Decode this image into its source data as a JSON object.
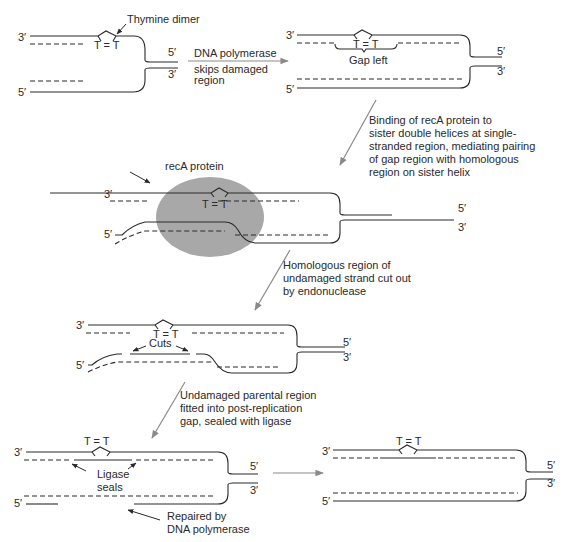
{
  "diagram": {
    "type": "post-replication recombination repair of thymine dimer",
    "colors": {
      "strand": "#2a2a2a",
      "step_arrow": "#8a8a8a",
      "recA_protein": "#a8a8a8",
      "background": "#ffffff"
    }
  },
  "ends": {
    "three_prime": "3′",
    "five_prime": "5′"
  },
  "lesion": {
    "label": "T = T"
  },
  "panel1": {
    "callout": "Thymine dimer"
  },
  "step1": {
    "line1": "DNA polymerase",
    "line2": "skips damaged",
    "line3": "region"
  },
  "panel2": {
    "callout": "Gap left"
  },
  "step2": {
    "line1": "Binding of recA protein to",
    "line2": "sister double helices at single-",
    "line3": "stranded region, mediating pairing",
    "line4": "of gap region with homologous",
    "line5": "region on sister helix"
  },
  "panel3": {
    "callout": "recA  protein"
  },
  "step3": {
    "line1": "Homologous region of",
    "line2": "undamaged strand cut out",
    "line3": "by endonuclease"
  },
  "panel4": {
    "callout": "Cuts"
  },
  "step4": {
    "line1": "Undamaged parental region",
    "line2": "fitted into post-replication",
    "line3": "gap, sealed with ligase"
  },
  "panel5": {
    "callout_ligase_1": "Ligase",
    "callout_ligase_2": "seals",
    "callout_repair_1": "Repaired by",
    "callout_repair_2": "DNA polymerase"
  },
  "panel6": {}
}
